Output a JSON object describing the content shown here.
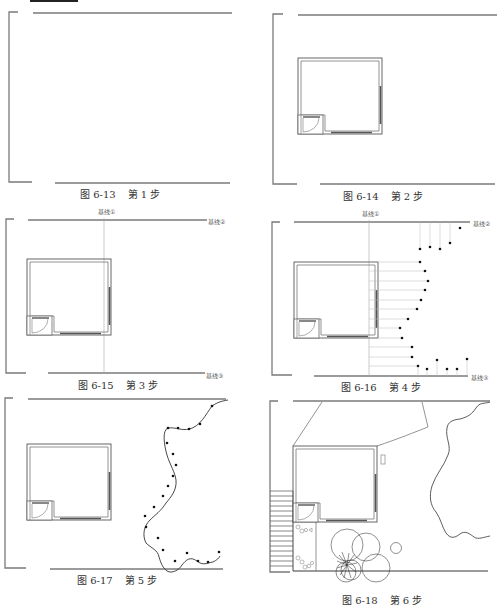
{
  "header": {
    "partial_text": "……（如图 6-13 所示）。"
  },
  "figures": [
    {
      "id": "fig-6-13",
      "number": "图 6-13",
      "step": "第 1 步"
    },
    {
      "id": "fig-6-14",
      "number": "图 6-14",
      "step": "第 2 步"
    },
    {
      "id": "fig-6-15",
      "number": "图 6-15",
      "step": "第 3 步",
      "labels": {
        "baseline1": "基线①",
        "baseline2": "基线②",
        "baseline3": "基线③"
      }
    },
    {
      "id": "fig-6-16",
      "number": "图 6-16",
      "step": "第 4 步",
      "labels": {
        "baseline1": "基线①",
        "baseline2": "基线②",
        "baseline3": "基线③"
      }
    },
    {
      "id": "fig-6-17",
      "number": "图 6-17",
      "step": "第 5 步"
    },
    {
      "id": "fig-6-18",
      "number": "图 6-18",
      "step": "第 6 步"
    }
  ],
  "colors": {
    "line": "#7a7a7a",
    "thin": "#9a9a9a",
    "ink": "#222222",
    "paper": "#ffffff"
  }
}
